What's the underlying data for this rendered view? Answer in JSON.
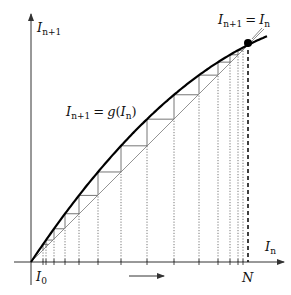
{
  "diagram": {
    "axes": {
      "x_label": {
        "main": "I",
        "sub": "n"
      },
      "y_label": {
        "main": "I",
        "sub": "n+1"
      },
      "origin_px": [
        31,
        262
      ],
      "x_axis_end_px": 284,
      "y_axis_top_px": 14
    },
    "labels": {
      "curve": {
        "lhs_main": "I",
        "lhs_sub": "n+1",
        "eq": "=",
        "func": "g(",
        "arg_main": "I",
        "arg_sub": "n",
        "close": ")"
      },
      "fixed_point": {
        "lhs_main": "I",
        "lhs_sub": "n+1",
        "eq": "=",
        "rhs_main": "I",
        "rhs_sub": "n"
      },
      "start": {
        "main": "I",
        "sub": "0"
      },
      "limit": "N"
    },
    "curve_model": {
      "a": 1.497,
      "b": 0.00229,
      "fixed_point_u": 217
    },
    "iterates_px_x": [
      43,
      46,
      54,
      65,
      79,
      98,
      121,
      147,
      174,
      199,
      218,
      230,
      238,
      243
    ],
    "fixed_point_px": [
      248,
      43
    ],
    "direction_arrow": {
      "x1": 129,
      "x2": 164,
      "y": 276
    },
    "colors": {
      "curve": "#000000",
      "diagonal": "#777777",
      "stairs": "#666666",
      "dotted": "#555555",
      "axis": "#333333"
    }
  }
}
